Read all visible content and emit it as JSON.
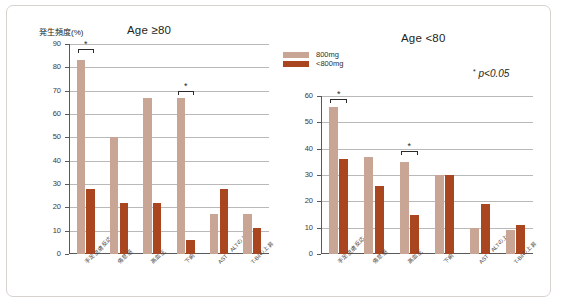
{
  "figure": {
    "legend": {
      "items": [
        {
          "label": "800mg",
          "color": "#c9a596",
          "key": "high"
        },
        {
          "label": "<800mg",
          "color": "#a9451f",
          "key": "low"
        }
      ]
    },
    "significance_note": "p<0.05",
    "significance_marker": "*"
  },
  "chart_data": [
    {
      "type": "bar",
      "id": "age-ge-80",
      "title": "Age ≥80",
      "ylabel": "発生頻度(%)",
      "xlabel": "",
      "ylim": [
        0,
        90
      ],
      "yticks": [
        0,
        10,
        20,
        30,
        40,
        50,
        60,
        70,
        80,
        90
      ],
      "grid": true,
      "legend_position": "top-right-shared",
      "categories": [
        "手足皮膚反応",
        "倦怠感",
        "高血圧",
        "下痢",
        "AST・ALTの上昇",
        "T-Bilの上昇"
      ],
      "series": [
        {
          "name": "800mg",
          "values": [
            83,
            50,
            67,
            67,
            17,
            17
          ]
        },
        {
          "name": "<800mg",
          "values": [
            28,
            22,
            22,
            6,
            28,
            11
          ]
        }
      ],
      "annotations": [
        {
          "type": "significance",
          "category_index": 0,
          "marker": "*",
          "y": 88
        },
        {
          "type": "significance",
          "category_index": 3,
          "marker": "*",
          "y": 70
        }
      ]
    },
    {
      "type": "bar",
      "id": "age-lt-80",
      "title": "Age <80",
      "ylabel": "",
      "xlabel": "",
      "ylim": [
        0,
        60
      ],
      "yticks": [
        0,
        10,
        20,
        30,
        40,
        50,
        60
      ],
      "grid": true,
      "legend_position": "top-left-shared",
      "categories": [
        "手足皮膚反応",
        "倦怠感",
        "高血圧",
        "下痢",
        "AST・ALTの上昇",
        "T-Bilの上昇"
      ],
      "series": [
        {
          "name": "800mg",
          "values": [
            56,
            37,
            35,
            30,
            10,
            9
          ]
        },
        {
          "name": "<800mg",
          "values": [
            36,
            26,
            15,
            30,
            19,
            11
          ]
        }
      ],
      "annotations": [
        {
          "type": "significance",
          "category_index": 0,
          "marker": "*",
          "y": 59
        },
        {
          "type": "significance",
          "category_index": 2,
          "marker": "*",
          "y": 39
        }
      ]
    }
  ]
}
